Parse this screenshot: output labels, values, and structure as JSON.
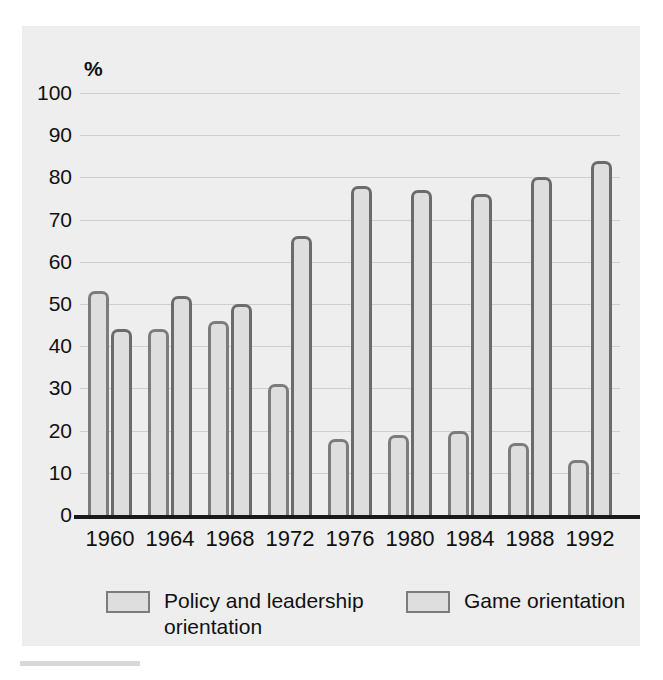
{
  "chart_data": {
    "type": "bar",
    "title": "",
    "subtitle": "",
    "xlabel": "",
    "ylabel": "%",
    "unit_label": "%",
    "ylim": [
      0,
      100
    ],
    "ytick_step": 10,
    "yticks": [
      100,
      90,
      80,
      70,
      60,
      50,
      40,
      30,
      20,
      10,
      0
    ],
    "grid": true,
    "grid_axis": "y",
    "legend_position": "bottom",
    "categories": [
      "1960",
      "1964",
      "1968",
      "1972",
      "1976",
      "1980",
      "1984",
      "1988",
      "1992"
    ],
    "series": [
      {
        "name": "Policy and leadership orientation",
        "values": [
          53,
          44,
          46,
          31,
          18,
          19,
          20,
          17,
          13
        ]
      },
      {
        "name": "Game orientation",
        "values": [
          44,
          52,
          50,
          66,
          78,
          77,
          76,
          80,
          84
        ]
      }
    ],
    "colors": {
      "bar_fill": "#dedede",
      "bar_border_policy": "#7c7c7c",
      "bar_border_game": "#6b6b6b",
      "panel_background": "#eeeeee",
      "gridline": "#cfcfcf",
      "axis_line": "#1a1a1a",
      "text": "#111111"
    }
  },
  "legend": {
    "entries": [
      {
        "label": "Policy and leadership orientation"
      },
      {
        "label": "Game orientation"
      }
    ]
  }
}
